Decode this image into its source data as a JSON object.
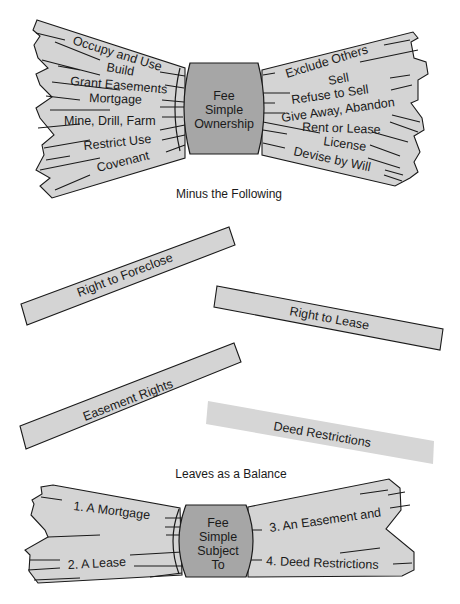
{
  "top_bundle": {
    "center": [
      "Fee",
      "Simple",
      "Ownership"
    ],
    "left_sticks": [
      "Occupy and Use",
      "Build",
      "Grant Easements",
      "Mortgage",
      "Mine, Drill, Farm",
      "Restrict Use",
      "Covenant"
    ],
    "right_sticks": [
      "Exclude Others",
      "Sell",
      "Refuse to Sell",
      "Give Away, Abandon",
      "Rent or Lease",
      "License",
      "Devise by Will"
    ]
  },
  "caption_minus": "Minus the Following",
  "loose_sticks": [
    "Right to Foreclose",
    "Right to Lease",
    "Easement Rights",
    "Deed Restrictions"
  ],
  "caption_balance": "Leaves as a Balance",
  "bottom_bundle": {
    "center": [
      "Fee",
      "Simple",
      "Subject",
      "To"
    ],
    "left_sticks": [
      "1. A Mortgage",
      "2. A Lease"
    ],
    "right_sticks": [
      "3. An Easement and",
      "4. Deed Restrictions"
    ]
  },
  "colors": {
    "stick_fill": "#d4d4d4",
    "band_fill": "#a6a6a6",
    "outline": "#1a1a1a"
  }
}
